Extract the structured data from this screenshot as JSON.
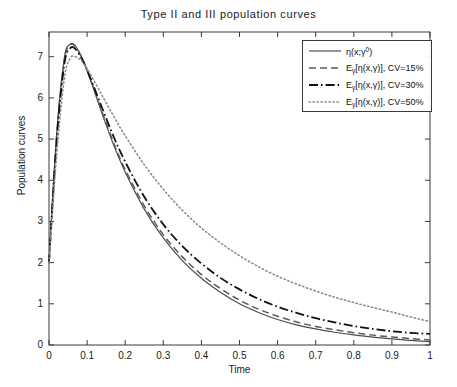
{
  "chart_data": {
    "type": "line",
    "title": "Type II and III population curves",
    "xlabel": "Time",
    "ylabel": "Population curves",
    "xlim": [
      0,
      1
    ],
    "ylim": [
      0,
      7.6
    ],
    "xticks": [
      "0",
      "0.1",
      "0.2",
      "0.3",
      "0.4",
      "0.5",
      "0.6",
      "0.7",
      "0.8",
      "0.9",
      "1"
    ],
    "yticks": [
      "0",
      "1",
      "2",
      "3",
      "4",
      "5",
      "6",
      "7"
    ],
    "grid": false,
    "legend_position": "upper right",
    "x": [
      0,
      0.02,
      0.04,
      0.055,
      0.07,
      0.09,
      0.11,
      0.14,
      0.17,
      0.2,
      0.25,
      0.3,
      0.35,
      0.4,
      0.45,
      0.5,
      0.55,
      0.6,
      0.65,
      0.7,
      0.75,
      0.8,
      0.85,
      0.9,
      0.95,
      1.0
    ],
    "series": [
      {
        "name": "eta(x;gamma0)",
        "legend_label": "η(x;γ⁰)",
        "style": "solid",
        "color": "#4d4d4d",
        "values": [
          2.0,
          5.1,
          6.95,
          7.3,
          7.25,
          6.9,
          6.4,
          5.6,
          4.85,
          4.2,
          3.3,
          2.6,
          2.05,
          1.62,
          1.28,
          1.0,
          0.79,
          0.62,
          0.49,
          0.39,
          0.31,
          0.245,
          0.19,
          0.15,
          0.11,
          0.08
        ]
      },
      {
        "name": "E_gamma[eta(x,gamma)] CV=15%",
        "legend_label": "Eγ[η(x,γ)], CV=15%",
        "style": "dashed",
        "color": "#5a5a5a",
        "values": [
          2.0,
          5.05,
          6.9,
          7.28,
          7.24,
          6.9,
          6.42,
          5.64,
          4.9,
          4.26,
          3.38,
          2.68,
          2.14,
          1.71,
          1.37,
          1.09,
          0.87,
          0.7,
          0.56,
          0.45,
          0.37,
          0.3,
          0.24,
          0.195,
          0.155,
          0.12
        ]
      },
      {
        "name": "E_gamma[eta(x,gamma)] CV=30%",
        "legend_label": "Eγ[η(x,γ)], CV=30%",
        "style": "dashdot",
        "color": "#111111",
        "values": [
          2.0,
          4.95,
          6.8,
          7.2,
          7.18,
          6.88,
          6.45,
          5.74,
          5.05,
          4.45,
          3.6,
          2.93,
          2.4,
          1.98,
          1.63,
          1.35,
          1.12,
          0.93,
          0.78,
          0.65,
          0.55,
          0.46,
          0.39,
          0.335,
          0.295,
          0.27
        ]
      },
      {
        "name": "E_gamma[eta(x,gamma)] CV=50%",
        "legend_label": "Eγ[η(x,γ)], CV=50%",
        "style": "dotted",
        "color": "#8c8c8c",
        "values": [
          2.0,
          4.6,
          6.45,
          6.95,
          7.0,
          6.85,
          6.55,
          6.05,
          5.55,
          5.08,
          4.38,
          3.78,
          3.27,
          2.84,
          2.48,
          2.17,
          1.9,
          1.67,
          1.48,
          1.31,
          1.16,
          1.03,
          0.91,
          0.8,
          0.68,
          0.57
        ]
      }
    ]
  },
  "legend": {
    "entries": [
      {
        "label_html": "η(x;γ",
        "sup": "0",
        "tail": ")",
        "style": "solid"
      },
      {
        "label_html": "E",
        "sub": "γ",
        "tail": "[η(x,γ)], CV=15%",
        "style": "dashed"
      },
      {
        "label_html": "E",
        "sub": "γ",
        "tail": "[η(x,γ)], CV=30%",
        "style": "dashdot"
      },
      {
        "label_html": "E",
        "sub": "γ",
        "tail": "[η(x,γ)], CV=50%",
        "style": "dotted"
      }
    ]
  },
  "colors": {
    "axis": "#3a3a3a",
    "solid": "#4d4d4d",
    "dashed": "#5a5a5a",
    "dashdot": "#111111",
    "dotted": "#8c8c8c",
    "background": "#ffffff"
  }
}
